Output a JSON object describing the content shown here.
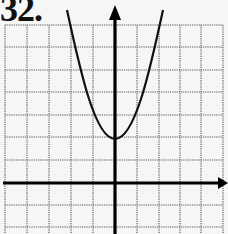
{
  "problem": {
    "number_label": "32."
  },
  "graph": {
    "type": "parabola",
    "description": "Upward-opening parabola with vertex on the y-axis two units above the origin",
    "vertex": [
      0,
      2
    ],
    "grid_units_x": [
      -5,
      5
    ],
    "grid_units_y": [
      -2,
      7
    ],
    "axes": {
      "x_arrow": "right",
      "y_arrow": "up"
    },
    "colors": {
      "grid": "#8a8a8a",
      "axis": "#000000",
      "curve": "#111111",
      "background": "#f6f6f6"
    }
  }
}
